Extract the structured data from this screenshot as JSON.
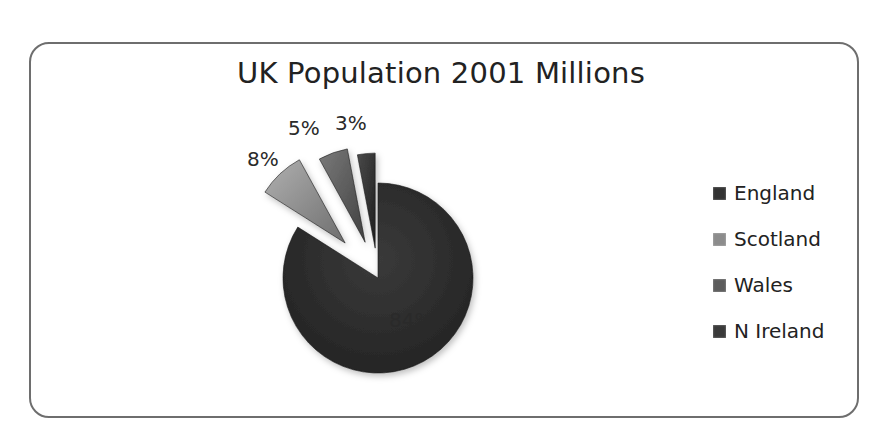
{
  "chart_data": {
    "type": "pie",
    "title": "UK Population 2001 Millions",
    "categories": [
      "England",
      "Scotland",
      "Wales",
      "N Ireland"
    ],
    "values": [
      84,
      8,
      5,
      3
    ],
    "labels": [
      "84%",
      "8%",
      "5%",
      "3%"
    ],
    "colors": [
      "#2e2e2e",
      "#8a8a8a",
      "#555555",
      "#2a2a2a"
    ],
    "exploded": [
      false,
      true,
      true,
      true
    ],
    "legend_position": "right"
  },
  "legend": [
    {
      "label": "England",
      "color": "#333333"
    },
    {
      "label": "Scotland",
      "color": "#8c8c8c"
    },
    {
      "label": "Wales",
      "color": "#5c5c5c"
    },
    {
      "label": "N Ireland",
      "color": "#3a3a3a"
    }
  ]
}
